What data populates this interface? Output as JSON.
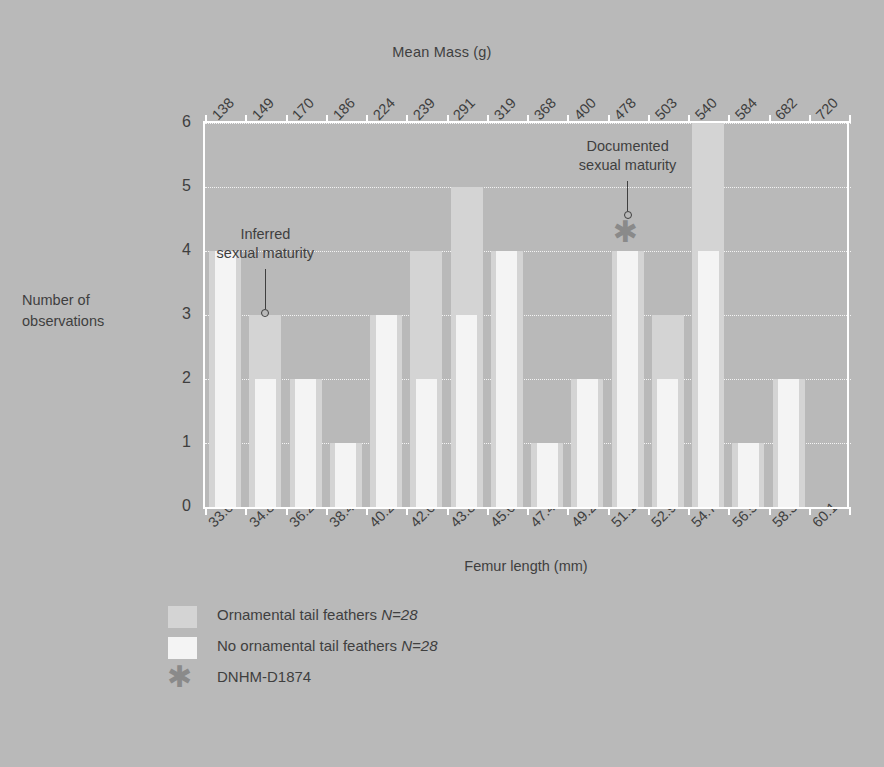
{
  "chart_data": {
    "type": "bar",
    "title": "",
    "xlabel": "Femur length (mm)",
    "ylabel": "Number of observations",
    "top_axis_label": "Mean Mass (g)",
    "ylim": [
      0,
      6
    ],
    "yticks": [
      "0",
      "1",
      "2",
      "3",
      "4",
      "5",
      "6"
    ],
    "grid": "horizontal-dotted",
    "legend_position": "below-plot-left",
    "categories": [
      "33.0",
      "34.8",
      "36.2",
      "38.4",
      "40.2",
      "42.0",
      "43.8",
      "45.6",
      "47.4",
      "49.2",
      "51.1",
      "52.9",
      "54.7",
      "56.5",
      "58.3",
      "60.1"
    ],
    "top_categories": [
      "138",
      "149",
      "170",
      "186",
      "224",
      "239",
      "291",
      "319",
      "368",
      "400",
      "478",
      "503",
      "540",
      "584",
      "682",
      "720"
    ],
    "series": [
      {
        "name": "Ornamental tail feathers N=28",
        "color": "#d4d4d4",
        "values": [
          4,
          3,
          2,
          1,
          3,
          4,
          5,
          4,
          1,
          2,
          4,
          3,
          6,
          1,
          2,
          0
        ]
      },
      {
        "name": "No ornamental tail feathers N=28",
        "color": "#f4f4f4",
        "values": [
          4,
          2,
          2,
          1,
          3,
          2,
          3,
          4,
          1,
          2,
          4,
          2,
          4,
          1,
          2,
          0
        ]
      }
    ],
    "annotations": [
      {
        "text": "Inferred\nsexual maturity",
        "category": "34.8",
        "value": 3
      },
      {
        "text": "Documented\nsexual maturity",
        "category": "51.1",
        "value": 4,
        "marker": "asterisk"
      }
    ]
  },
  "legend": {
    "items": [
      {
        "marker": "swatch-ornamental",
        "label": "Ornamental tail feathers ",
        "emphasis": "N=28"
      },
      {
        "marker": "swatch-no-ornamental",
        "label": "No ornamental tail feathers ",
        "emphasis": "N=28"
      },
      {
        "marker": "asterisk",
        "label": "DNHM-D1874",
        "emphasis": ""
      }
    ]
  },
  "colors": {
    "background": "#b9b9b9",
    "ornamental": "#d4d4d4",
    "no_ornamental": "#f4f4f4",
    "text": "#3f3f3f",
    "axis": "#ffffff",
    "asterisk": "#8a8a8a"
  },
  "axis_titles": {
    "top": "Mean Mass (g)",
    "bottom": "Femur length (mm)",
    "left_line1": "Number of",
    "left_line2": "observations"
  }
}
